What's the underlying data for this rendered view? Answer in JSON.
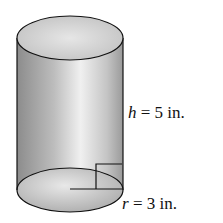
{
  "figure": {
    "shape": "cylinder",
    "labels": {
      "height": {
        "variable": "h",
        "text": " = 5 in."
      },
      "radius": {
        "variable": "r",
        "text": " = 3 in."
      }
    },
    "colors": {
      "stroke": "#111111",
      "body_dark": "#8a8a8a",
      "body_light": "#f2f2f2",
      "top_fill": "#d6d6d6",
      "bottom_fill": "#c8c8c8"
    }
  }
}
